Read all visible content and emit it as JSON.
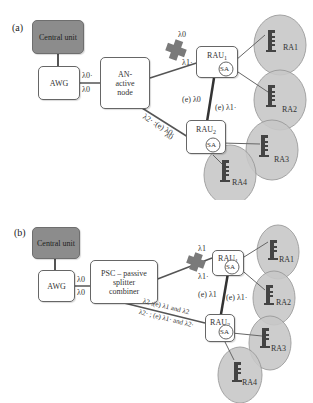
{
  "panel_a": {
    "tag": "(a)",
    "central_unit": "Central unit",
    "awg": "AWG",
    "awg_out_top": "λ0·",
    "awg_out_bottom": "λ0",
    "node": "AN-active node",
    "node_line1": "AN-",
    "node_line2": "active",
    "node_line3": "node",
    "cross_top": "λ0",
    "cross_bottom": "λ1·",
    "rau1": "RAU",
    "rau1_sub": "1",
    "rau2": "RAU",
    "rau2_sub": "2",
    "sa": "SA",
    "link_left": "(e) λ0",
    "link_right": "(e) λ1·",
    "lower_upper": "λ2· :(e) λ0·",
    "lower_lower": "λ0",
    "ra_labels": [
      "RA1",
      "RA2",
      "RA3",
      "RA4"
    ]
  },
  "panel_b": {
    "tag": "(b)",
    "central_unit": "Central unit",
    "awg": "AWG",
    "awg_out_top": "λ0",
    "awg_out_bottom": "λ0",
    "node_line1": "PSC – passive",
    "node_line2": "splitter",
    "node_line3": "combiner",
    "cross_top": "λ1",
    "cross_bottom": "λ1·",
    "rau1": "RAU",
    "rau1_sub": "1",
    "rau2": "RAU",
    "rau2_sub": "2",
    "sa": "SA",
    "link_left": "(e) λ1",
    "link_right": "(e) λ1·",
    "lower_upper": "λ2 ;(e) λ1 and λ2",
    "lower_lower": "λ2· ; (e) λ1· and λ2·",
    "ra_labels": [
      "RA1",
      "RA2",
      "RA3",
      "RA4"
    ]
  },
  "colors": {
    "central_unit_fill": "#8c8c8c",
    "cell_fill": "#c8c8c8",
    "cell_stroke": "#9a9a9a",
    "fiber": "#555555",
    "cross": "#7a7a7a",
    "antenna": "#444444"
  }
}
